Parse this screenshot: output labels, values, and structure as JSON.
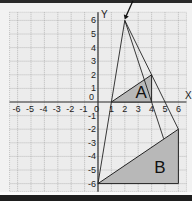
{
  "diagram": {
    "type": "coordinate-grid",
    "x_axis": {
      "label": "X",
      "min": -6,
      "max": 6,
      "ticks": [
        "-6",
        "-5",
        "-4",
        "-3",
        "-2",
        "-1",
        "0",
        "1",
        "2",
        "3",
        "4",
        "5",
        "6"
      ]
    },
    "y_axis": {
      "label": "Y",
      "min": -6,
      "max": 6,
      "ticks": [
        "6",
        "5",
        "4",
        "3",
        "2",
        "1",
        "0",
        "-1",
        "-2",
        "-3",
        "-4",
        "-5",
        "-6"
      ]
    },
    "apex": [
      2,
      6
    ],
    "shapes": [
      {
        "label": "A",
        "vertices": [
          [
            1,
            0
          ],
          [
            4,
            2
          ],
          [
            4,
            0
          ]
        ],
        "fill": "#b8b8b8"
      },
      {
        "label": "B",
        "vertices": [
          [
            0,
            -6
          ],
          [
            6,
            -2
          ],
          [
            6,
            -6
          ]
        ],
        "fill": "#b8b8b8"
      }
    ],
    "rays": [
      {
        "from": [
          2,
          6
        ],
        "to": [
          0,
          -6
        ]
      },
      {
        "from": [
          2,
          6
        ],
        "to": [
          6,
          -2
        ]
      },
      {
        "from": [
          2,
          6
        ],
        "to": [
          4.9,
          -2.7
        ]
      }
    ],
    "colors": {
      "grid": "#9a9a9a",
      "axis": "#333333",
      "shape_fill": "#b8b8b8",
      "line": "#222222"
    }
  }
}
